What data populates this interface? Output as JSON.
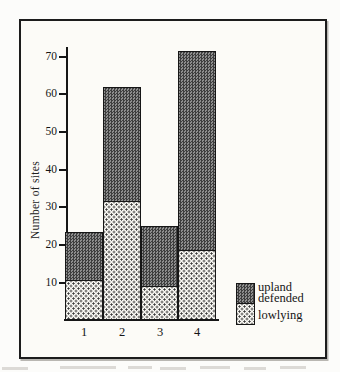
{
  "chart_data": {
    "type": "bar",
    "stacked": true,
    "title": "",
    "xlabel": "",
    "ylabel": "Number of sites",
    "categories": [
      "1",
      "2",
      "3",
      "4"
    ],
    "series": [
      {
        "name": "lowlying",
        "pattern": "dotted",
        "values": [
          10.5,
          31.5,
          9,
          18.5
        ]
      },
      {
        "name": "upland defended",
        "pattern": "checker",
        "values": [
          13,
          30.5,
          16,
          53
        ]
      }
    ],
    "totals": [
      23.5,
      62,
      25,
      71.5
    ],
    "ylim": [
      0,
      75
    ],
    "yticks": [
      10,
      20,
      30,
      40,
      50,
      60,
      70
    ],
    "grid": false,
    "legend_position": "bottom-right",
    "legend": [
      {
        "label": "upland defended",
        "swatch": "checker"
      },
      {
        "label": "lowlying",
        "swatch": "dotted"
      }
    ]
  },
  "legend_display": {
    "upland_line1": "upland",
    "upland_line2": "defended",
    "lowlying": "lowlying"
  },
  "colors": {
    "frame": "#1c1c1c",
    "checker_dark": "#3e3e3e",
    "checker_light": "#8e8e8e",
    "dot": "#3a3a3a",
    "paper": "#fcfbf7"
  }
}
